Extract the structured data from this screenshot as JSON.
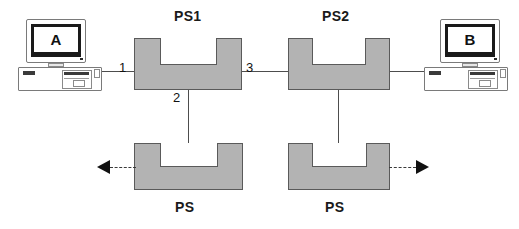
{
  "diagram": {
    "title_hidden": "",
    "nodes": {
      "switch1": {
        "label": "PS1"
      },
      "switch2": {
        "label": "PS2"
      },
      "switch3": {
        "label": "PS"
      },
      "switch4": {
        "label": "PS"
      },
      "host_a": {
        "label": "A"
      },
      "host_b": {
        "label": "B"
      }
    },
    "port_labels": {
      "port1": "1",
      "port2": "2",
      "port3": "3"
    },
    "colors": {
      "box_fill": "#b3b3b3",
      "box_stroke": "#5a5a5a",
      "notch_fill": "#ffffff",
      "wire": "#4d4d4d",
      "arrow": "#111111",
      "text": "#1a1a1a",
      "background": "#ffffff"
    },
    "icons": {
      "host_a_icon": "desktop-computer-icon",
      "host_b_icon": "desktop-computer-icon",
      "arrow_left_icon": "arrow-left-icon",
      "arrow_right_icon": "arrow-right-icon"
    }
  }
}
